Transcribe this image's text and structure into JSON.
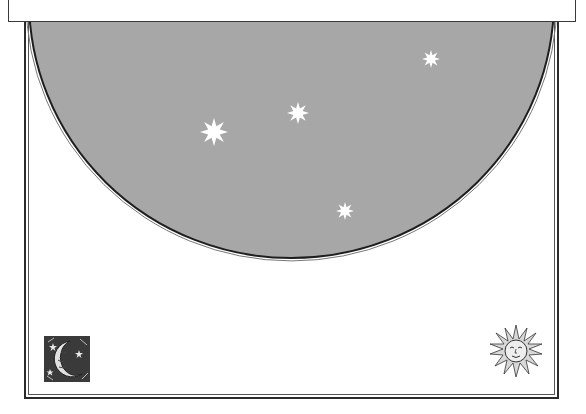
{
  "scene": {
    "background": "#ffffff",
    "sky_color": "#a7a7a7",
    "star_color": "#ffffff",
    "border_color": "#2b2b2b"
  },
  "header_panel": {
    "text": ""
  },
  "sky": {
    "shape": "half-ellipse",
    "stars": [
      {
        "name": "star-large",
        "x": 214,
        "y": 132,
        "r": 14
      },
      {
        "name": "star-medium",
        "x": 298,
        "y": 113,
        "r": 11
      },
      {
        "name": "star-top-right",
        "x": 431,
        "y": 59,
        "r": 9
      },
      {
        "name": "star-lower",
        "x": 345,
        "y": 211,
        "r": 9
      }
    ]
  },
  "ornaments": {
    "moon": {
      "label": "crescent-moon woodcut"
    },
    "sun": {
      "label": "sun face woodcut"
    }
  }
}
